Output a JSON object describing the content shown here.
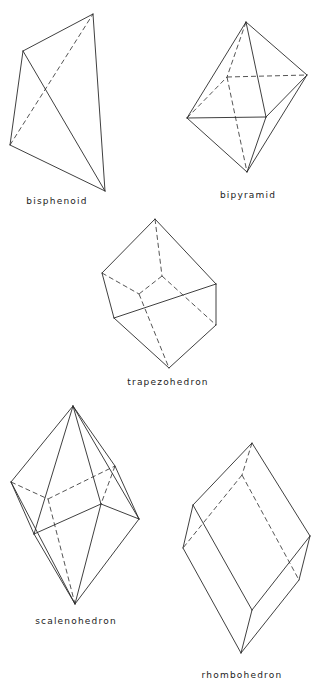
{
  "figure": {
    "crystals": [
      {
        "name": "bisphenoid",
        "label": "bisphenoid",
        "label_pos": [
          57,
          203
        ],
        "solid": [
          [
            93,
            14,
            23,
            51
          ],
          [
            23,
            51,
            10,
            145
          ],
          [
            10,
            145,
            105,
            191
          ],
          [
            105,
            191,
            93,
            14
          ],
          [
            23,
            51,
            105,
            191
          ]
        ],
        "dashed": [
          [
            10,
            145,
            93,
            14
          ]
        ]
      },
      {
        "name": "bipyramid",
        "label": "bipyramid",
        "label_pos": [
          248,
          197
        ],
        "solid": [
          [
            246,
            22,
            187,
            118
          ],
          [
            246,
            22,
            266,
            117
          ],
          [
            246,
            22,
            307,
            75
          ],
          [
            187,
            118,
            266,
            117
          ],
          [
            266,
            117,
            307,
            75
          ],
          [
            187,
            118,
            247,
            172
          ],
          [
            266,
            117,
            247,
            172
          ],
          [
            307,
            75,
            247,
            172
          ]
        ],
        "dashed": [
          [
            246,
            22,
            227,
            77
          ],
          [
            187,
            118,
            227,
            77
          ],
          [
            227,
            77,
            307,
            75
          ],
          [
            227,
            77,
            247,
            172
          ]
        ]
      },
      {
        "name": "trapezohedron",
        "label": "trapezohedron",
        "label_pos": [
          168,
          384
        ],
        "solid": [
          [
            155,
            219,
            102,
            273
          ],
          [
            155,
            219,
            216,
            284
          ],
          [
            102,
            273,
            114,
            318
          ],
          [
            114,
            318,
            216,
            284
          ],
          [
            216,
            284,
            216,
            325
          ],
          [
            114,
            318,
            169,
            368
          ],
          [
            169,
            368,
            216,
            325
          ]
        ],
        "dashed": [
          [
            155,
            219,
            162,
            276
          ],
          [
            162,
            276,
            139,
            294
          ],
          [
            102,
            273,
            139,
            294
          ],
          [
            162,
            276,
            216,
            325
          ],
          [
            139,
            294,
            169,
            368
          ]
        ]
      },
      {
        "name": "scalenohedron",
        "label": "scalenohedron",
        "label_pos": [
          76,
          623
        ],
        "solid": [
          [
            73,
            406,
            11,
            482
          ],
          [
            73,
            406,
            34,
            534
          ],
          [
            73,
            406,
            101,
            504
          ],
          [
            73,
            406,
            139,
            519
          ],
          [
            73,
            406,
            115,
            466
          ],
          [
            11,
            482,
            34,
            534
          ],
          [
            34,
            534,
            101,
            504
          ],
          [
            101,
            504,
            139,
            519
          ],
          [
            115,
            466,
            139,
            519
          ],
          [
            11,
            482,
            75,
            604
          ],
          [
            34,
            534,
            75,
            604
          ],
          [
            101,
            504,
            75,
            604
          ],
          [
            139,
            519,
            75,
            604
          ]
        ],
        "dashed": [
          [
            11,
            482,
            48,
            499
          ],
          [
            48,
            499,
            115,
            466
          ],
          [
            48,
            499,
            75,
            604
          ],
          [
            115,
            466,
            101,
            504
          ]
        ]
      },
      {
        "name": "rhombohedron",
        "label": "rhombohedron",
        "label_pos": [
          242,
          677
        ],
        "solid": [
          [
            252,
            443,
            193,
            505
          ],
          [
            252,
            443,
            310,
            536
          ],
          [
            193,
            505,
            183,
            548
          ],
          [
            193,
            505,
            252,
            610
          ],
          [
            183,
            548,
            241,
            653
          ],
          [
            252,
            610,
            241,
            653
          ],
          [
            252,
            610,
            310,
            536
          ],
          [
            310,
            536,
            299,
            580
          ],
          [
            299,
            580,
            241,
            653
          ]
        ],
        "dashed": [
          [
            252,
            443,
            242,
            475
          ],
          [
            242,
            475,
            183,
            548
          ],
          [
            242,
            475,
            299,
            580
          ]
        ]
      }
    ]
  }
}
